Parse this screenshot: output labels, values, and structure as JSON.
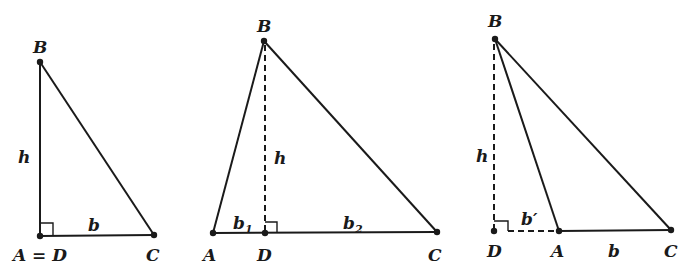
{
  "diagram": {
    "colors": {
      "ink": "#1a1a1a",
      "background": "#ffffff"
    },
    "triangles": [
      {
        "id": "right-angle-at-A",
        "labels": {
          "B": "B",
          "h": "h",
          "b": "b",
          "AD": "A = D",
          "C": "C"
        }
      },
      {
        "id": "altitude-inside",
        "labels": {
          "B": "B",
          "h": "h",
          "b1": "b",
          "b1_sub": "1",
          "b2": "b",
          "b2_sub": "2",
          "A": "A",
          "D": "D",
          "C": "C"
        }
      },
      {
        "id": "altitude-outside",
        "labels": {
          "B": "B",
          "h": "h",
          "bprime": "b′",
          "D": "D",
          "A": "A",
          "b": "b",
          "C": "C"
        }
      }
    ]
  }
}
